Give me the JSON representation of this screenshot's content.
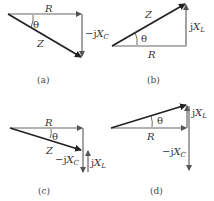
{
  "diagram": {
    "panels": [
      {
        "id": "a",
        "caption": "(a)",
        "labels": {
          "horizontal": "R",
          "hypotenuse": "Z",
          "angle": "θ",
          "vertical_prefix": "−j",
          "vertical_var": "X",
          "vertical_sub": "C"
        }
      },
      {
        "id": "b",
        "caption": "(b)",
        "labels": {
          "horizontal": "R",
          "hypotenuse": "Z",
          "angle": "θ",
          "vertical_prefix": "j",
          "vertical_var": "X",
          "vertical_sub": "L"
        }
      },
      {
        "id": "c",
        "caption": "(c)",
        "labels": {
          "horizontal": "R",
          "hypotenuse": "Z",
          "angle": "θ",
          "vertical1_prefix": "−j",
          "vertical1_var": "X",
          "vertical1_sub": "C",
          "vertical2_prefix": "j",
          "vertical2_var": "X",
          "vertical2_sub": "L"
        }
      },
      {
        "id": "d",
        "caption": "(d)",
        "labels": {
          "horizontal": "R",
          "angle": "θ",
          "vertical1_prefix": "j",
          "vertical1_var": "X",
          "vertical1_sub": "L",
          "vertical2_prefix": "−j",
          "vertical2_var": "X",
          "vertical2_sub": "C"
        }
      }
    ],
    "colors": {
      "line": "#555555",
      "hypotenuse": "#222222"
    }
  }
}
